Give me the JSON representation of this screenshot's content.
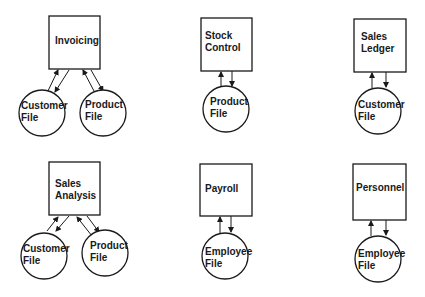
{
  "diagram": {
    "title": "",
    "systems": [
      {
        "name": "Invoicing",
        "lines": [
          "Invoicing"
        ],
        "files": [
          {
            "lines": [
              "Customer",
              "File"
            ]
          },
          {
            "lines": [
              "Product",
              "File"
            ]
          }
        ]
      },
      {
        "name": "Stock Control",
        "lines": [
          "Stock",
          "Control"
        ],
        "files": [
          {
            "lines": [
              "Product",
              "File"
            ]
          }
        ]
      },
      {
        "name": "Sales Ledger",
        "lines": [
          "Sales",
          "Ledger"
        ],
        "files": [
          {
            "lines": [
              "Customer",
              "File"
            ]
          }
        ]
      },
      {
        "name": "Sales Analysis",
        "lines": [
          "Sales",
          "Analysis"
        ],
        "files": [
          {
            "lines": [
              "Customer",
              "File"
            ]
          },
          {
            "lines": [
              "Product",
              "File"
            ]
          }
        ]
      },
      {
        "name": "Payroll",
        "lines": [
          "Payroll"
        ],
        "files": [
          {
            "lines": [
              "Employee",
              "File"
            ]
          }
        ]
      },
      {
        "name": "Personnel",
        "lines": [
          "Personnel"
        ],
        "files": [
          {
            "lines": [
              "Employee",
              "File"
            ]
          }
        ]
      }
    ]
  }
}
